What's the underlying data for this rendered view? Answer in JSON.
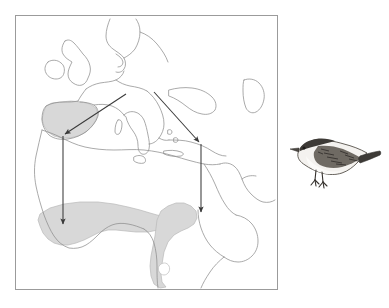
{
  "figure": {
    "kind": "migration-map",
    "caption": ""
  },
  "map": {
    "frame_color": "#9b9b9b",
    "coastline_color": "#8d8d8d",
    "range_fill": "#d8d8d8",
    "range_stroke": "#b4b4b4",
    "arrow_color": "#3a3a3a",
    "background": "#ffffff",
    "regions": [
      {
        "name": "iberian-breeding-range",
        "label": ""
      },
      {
        "name": "west-africa-wintering-range",
        "label": ""
      },
      {
        "name": "east-africa-wintering-range",
        "label": ""
      }
    ],
    "arrows": [
      {
        "name": "western-flyway-diagonal",
        "label": ""
      },
      {
        "name": "western-flyway-vertical",
        "label": ""
      },
      {
        "name": "eastern-flyway-diagonal",
        "label": ""
      },
      {
        "name": "eastern-flyway-vertical",
        "label": ""
      }
    ],
    "lake_hole": {
      "name": "lake-victoria-hole",
      "label": ""
    }
  },
  "bird": {
    "name": "warbler-illustration",
    "label": "",
    "plumage_dark": "#3d3a36",
    "plumage_mid": "#6b6660",
    "plumage_light": "#f3f1ee"
  }
}
